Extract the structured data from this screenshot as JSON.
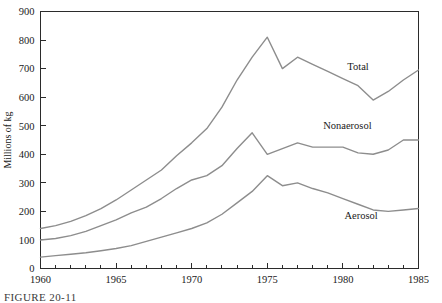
{
  "figure": {
    "caption": "FIGURE 20-11",
    "ylabel": "Millions of kg"
  },
  "axes": {
    "y_ticks": [
      "0",
      "100",
      "200",
      "300",
      "400",
      "500",
      "600",
      "700",
      "800",
      "900"
    ],
    "x_ticks": [
      "1960",
      "1965",
      "1970",
      "1975",
      "1980",
      "1985"
    ]
  },
  "series_labels": {
    "total": "Total",
    "nonaerosol": "Nonaerosol",
    "aerosol": "Aerosol"
  },
  "colors": {
    "line": "#8d8d8d",
    "axis": "#2b2b2b",
    "background": "#ffffff",
    "text": "#1a1a1a"
  },
  "chart_data": {
    "type": "line",
    "title": "",
    "xlabel": "",
    "ylabel": "Millions of kg",
    "xlim": [
      1960,
      1985
    ],
    "ylim": [
      0,
      900
    ],
    "grid": false,
    "legend": "inline-labels",
    "x": [
      1960,
      1961,
      1962,
      1963,
      1964,
      1965,
      1966,
      1967,
      1968,
      1969,
      1970,
      1971,
      1972,
      1973,
      1974,
      1975,
      1976,
      1977,
      1978,
      1979,
      1980,
      1981,
      1982,
      1983,
      1984,
      1985
    ],
    "series": [
      {
        "name": "Total",
        "values": [
          140,
          150,
          165,
          185,
          210,
          240,
          275,
          310,
          345,
          395,
          440,
          490,
          565,
          660,
          740,
          810,
          700,
          740,
          715,
          690,
          665,
          640,
          590,
          620,
          660,
          695
        ]
      },
      {
        "name": "Nonaerosol",
        "values": [
          100,
          105,
          115,
          130,
          150,
          170,
          195,
          215,
          245,
          280,
          310,
          325,
          360,
          420,
          475,
          400,
          420,
          440,
          425,
          425,
          425,
          405,
          400,
          415,
          450,
          450
        ]
      },
      {
        "name": "Aerosol",
        "values": [
          40,
          45,
          50,
          55,
          62,
          70,
          80,
          95,
          110,
          125,
          140,
          160,
          190,
          230,
          270,
          325,
          290,
          300,
          280,
          265,
          245,
          225,
          205,
          200,
          205,
          210
        ]
      }
    ],
    "annotations": [
      {
        "text": "Total",
        "x": 1981.0,
        "y": 695
      },
      {
        "text": "Nonaerosol",
        "x": 1980.3,
        "y": 490
      },
      {
        "text": "Aerosol",
        "x": 1981.2,
        "y": 175
      }
    ]
  }
}
